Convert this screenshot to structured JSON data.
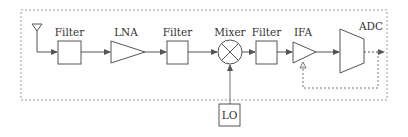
{
  "diagram": {
    "colors": {
      "stroke": "#555555",
      "dashed": "#888888",
      "text": "#333333",
      "background": "#ffffff"
    },
    "blocks": [
      {
        "id": "antenna",
        "label": "",
        "icon": "antenna-icon"
      },
      {
        "id": "filter1",
        "label": "Filter"
      },
      {
        "id": "lna",
        "label": "LNA"
      },
      {
        "id": "filter2",
        "label": "Filter"
      },
      {
        "id": "mixer",
        "label": "Mixer"
      },
      {
        "id": "filter3",
        "label": "Filter"
      },
      {
        "id": "ifa",
        "label": "IFA"
      },
      {
        "id": "adc",
        "label": "ADC"
      },
      {
        "id": "lo",
        "label": "LO"
      }
    ],
    "connections": [
      [
        "antenna",
        "filter1"
      ],
      [
        "filter1",
        "lna"
      ],
      [
        "lna",
        "filter2"
      ],
      [
        "filter2",
        "mixer"
      ],
      [
        "mixer",
        "filter3"
      ],
      [
        "filter3",
        "ifa"
      ],
      [
        "ifa",
        "adc"
      ],
      [
        "lo",
        "mixer"
      ],
      [
        "adc",
        "ifa",
        "feedback (dashed)"
      ]
    ]
  }
}
